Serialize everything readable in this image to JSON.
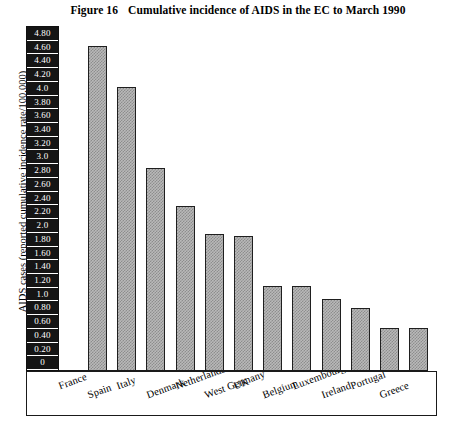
{
  "figure": {
    "number": "Figure 16",
    "title": "Cumulative incidence of AIDS in the EC to March 1990"
  },
  "axes": {
    "y_title": "AIDS cases (reported cumulative incidence rate/100,000)",
    "y_ticks": [
      "4.80",
      "4.60",
      "4.40",
      "4.20",
      "4.0",
      "3.80",
      "3.60",
      "3.40",
      "3.20",
      "3.0",
      "2.80",
      "2.60",
      "2.40",
      "2.20",
      "2.0",
      "1.80",
      "1.60",
      "1.40",
      "1.20",
      "1.0",
      "0.80",
      "0.60",
      "0.40",
      "0.20",
      "0"
    ]
  },
  "colors": {
    "bar_fill": "#b9b9b9",
    "bar_pattern": "#8d8d8d",
    "bar_border": "#1f1f1f",
    "tick_chip_background": "#151515",
    "tick_chip_text": "#ffffff",
    "frame": "#1a1a1a",
    "background": "#ffffff"
  },
  "chart_data": {
    "type": "bar",
    "title": "Cumulative incidence of AIDS in the EC to March 1990",
    "xlabel": "",
    "ylabel": "AIDS cases (reported cumulative incidence rate/100,000)",
    "ylim": [
      0,
      4.8
    ],
    "ytick_step": 0.2,
    "grid": false,
    "legend": false,
    "categories": [
      "France",
      "Spain",
      "Italy",
      "Denmark",
      "Netherlands",
      "West Germany",
      "UK",
      "Belgium",
      "Luxembourg",
      "Ireland",
      "Portugal",
      "Greece"
    ],
    "values": [
      4.52,
      3.95,
      2.82,
      2.3,
      1.9,
      1.88,
      1.18,
      1.18,
      1.0,
      0.88,
      0.6,
      0.6
    ]
  }
}
